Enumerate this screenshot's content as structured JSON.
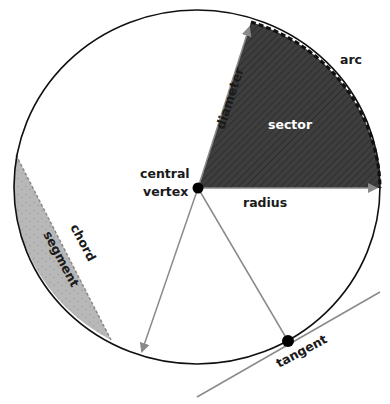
{
  "diagram": {
    "labels": {
      "arc": "arc",
      "sector": "sector",
      "diameter": "diameter",
      "central": "central",
      "vertex": "vertex",
      "radius": "radius",
      "chord": "chord",
      "segment": "segment",
      "tangent": "tangent"
    },
    "colors": {
      "outline": "#111111",
      "sector_fill": "#3c3c3c",
      "segment_fill": "#b5b5b5",
      "line_gray": "#8a8a8a",
      "point": "#000000"
    }
  }
}
